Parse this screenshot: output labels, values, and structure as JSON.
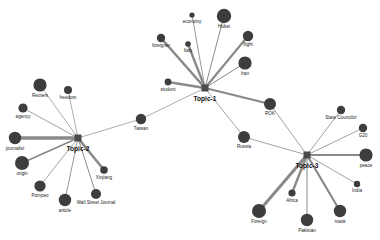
{
  "figure": {
    "kind": "topic-word-network",
    "background_color": "#ffffff",
    "node_color": "#3d3d3d",
    "topic_node_color": "#4a4a4a",
    "edge_color": "#8a8a8a",
    "label_color": "#1a1a1a"
  },
  "topics": [
    {
      "id": "topic1",
      "label": "Topic-1",
      "x": 205,
      "y": 88,
      "size": 7
    },
    {
      "id": "topic2",
      "label": "Topic-2",
      "x": 78,
      "y": 138,
      "size": 7
    },
    {
      "id": "topic3",
      "label": "Topic-3",
      "x": 307,
      "y": 155,
      "size": 7
    }
  ],
  "words": [
    {
      "id": "economy",
      "label": "economy",
      "x": 192,
      "y": 15,
      "r": 2.6,
      "label_dx": 0,
      "label_dy": 7
    },
    {
      "id": "hubei",
      "label": "Hubei",
      "x": 224,
      "y": 16,
      "r": 7.2,
      "label_dx": 0,
      "label_dy": 11
    },
    {
      "id": "foreigner",
      "label": "foreigner",
      "x": 161,
      "y": 38,
      "r": 4.2,
      "label_dx": 0,
      "label_dy": 8
    },
    {
      "id": "italy",
      "label": "Italy",
      "x": 188,
      "y": 44,
      "r": 2.8,
      "label_dx": 0,
      "label_dy": 6.5
    },
    {
      "id": "flight",
      "label": "flight",
      "x": 248,
      "y": 36,
      "r": 5.2,
      "label_dx": 0,
      "label_dy": 9
    },
    {
      "id": "iran",
      "label": "Iran",
      "x": 245,
      "y": 63,
      "r": 6.6,
      "label_dx": 0,
      "label_dy": 11
    },
    {
      "id": "student",
      "label": "student",
      "x": 168,
      "y": 82,
      "r": 3.4,
      "label_dx": 0,
      "label_dy": 7.5
    },
    {
      "id": "taiwan",
      "label": "Taiwan",
      "x": 141,
      "y": 119,
      "r": 5.2,
      "label_dx": 0,
      "label_dy": 9.5
    },
    {
      "id": "rok",
      "label": "ROK",
      "x": 270,
      "y": 104,
      "r": 6.0,
      "label_dx": 0,
      "label_dy": 10
    },
    {
      "id": "russia",
      "label": "Russia",
      "x": 244,
      "y": 137,
      "r": 6.0,
      "label_dx": 0,
      "label_dy": 10
    },
    {
      "id": "reuters",
      "label": "Reuters",
      "x": 40,
      "y": 85,
      "r": 6.6,
      "label_dx": 0,
      "label_dy": 11
    },
    {
      "id": "freedom",
      "label": "freedom",
      "x": 68,
      "y": 90,
      "r": 4.0,
      "label_dx": 0,
      "label_dy": 8
    },
    {
      "id": "agency",
      "label": "agency",
      "x": 23,
      "y": 108,
      "r": 4.6,
      "label_dx": 0,
      "label_dy": 8.5
    },
    {
      "id": "journalist",
      "label": "journalist",
      "x": 15,
      "y": 138,
      "r": 6.2,
      "label_dx": 0,
      "label_dy": 10.5
    },
    {
      "id": "origin",
      "label": "origin",
      "x": 22,
      "y": 163,
      "r": 7.0,
      "label_dx": 0,
      "label_dy": 11
    },
    {
      "id": "pompeo",
      "label": "Pompeo",
      "x": 40,
      "y": 186,
      "r": 5.6,
      "label_dx": 0,
      "label_dy": 9.5
    },
    {
      "id": "article",
      "label": "article",
      "x": 65,
      "y": 200,
      "r": 6.2,
      "label_dx": 0,
      "label_dy": 10.5
    },
    {
      "id": "wsj",
      "label": "Wall Street Journal",
      "x": 96,
      "y": 194,
      "r": 5.0,
      "label_dx": 0,
      "label_dy": 9
    },
    {
      "id": "xinjiang",
      "label": "Xinjiang",
      "x": 104,
      "y": 170,
      "r": 3.8,
      "label_dx": 0,
      "label_dy": 8
    },
    {
      "id": "statecouncilor",
      "label": "State Councilor",
      "x": 341,
      "y": 110,
      "r": 4.2,
      "label_dx": 0,
      "label_dy": 8
    },
    {
      "id": "g20",
      "label": "G20",
      "x": 363,
      "y": 128,
      "r": 4.2,
      "label_dx": 0,
      "label_dy": 8
    },
    {
      "id": "peace",
      "label": "peace",
      "x": 366,
      "y": 155,
      "r": 6.6,
      "label_dx": 0,
      "label_dy": 10.5
    },
    {
      "id": "india",
      "label": "India",
      "x": 357,
      "y": 184,
      "r": 3.2,
      "label_dx": 0,
      "label_dy": 7
    },
    {
      "id": "mask",
      "label": "mask",
      "x": 340,
      "y": 211,
      "r": 6.2,
      "label_dx": 0,
      "label_dy": 10.5
    },
    {
      "id": "pakistan",
      "label": "Pakistan",
      "x": 307,
      "y": 220,
      "r": 6.2,
      "label_dx": 0,
      "label_dy": 10.5
    },
    {
      "id": "africa",
      "label": "Africa",
      "x": 292,
      "y": 193,
      "r": 3.6,
      "label_dx": 0,
      "label_dy": 7.5
    },
    {
      "id": "foreign",
      "label": "Foreign",
      "x": 259,
      "y": 211,
      "r": 7.0,
      "label_dx": 0,
      "label_dy": 11
    }
  ],
  "edges": [
    {
      "from": "topic1",
      "to": "economy",
      "width": 0.9
    },
    {
      "from": "topic1",
      "to": "hubei",
      "width": 1.0
    },
    {
      "from": "topic1",
      "to": "foreigner",
      "width": 2.6
    },
    {
      "from": "topic1",
      "to": "italy",
      "width": 2.4
    },
    {
      "from": "topic1",
      "to": "flight",
      "width": 2.2
    },
    {
      "from": "topic1",
      "to": "iran",
      "width": 1.0
    },
    {
      "from": "topic1",
      "to": "student",
      "width": 2.4
    },
    {
      "from": "topic1",
      "to": "taiwan",
      "width": 0.7
    },
    {
      "from": "topic1",
      "to": "rok",
      "width": 2.2
    },
    {
      "from": "topic1",
      "to": "russia",
      "width": 0.8
    },
    {
      "from": "topic2",
      "to": "reuters",
      "width": 0.7
    },
    {
      "from": "topic2",
      "to": "freedom",
      "width": 0.7
    },
    {
      "from": "topic2",
      "to": "agency",
      "width": 0.8
    },
    {
      "from": "topic2",
      "to": "journalist",
      "width": 3.4
    },
    {
      "from": "topic2",
      "to": "origin",
      "width": 1.8
    },
    {
      "from": "topic2",
      "to": "pompeo",
      "width": 0.8
    },
    {
      "from": "topic2",
      "to": "article",
      "width": 0.9
    },
    {
      "from": "topic2",
      "to": "wsj",
      "width": 1.0
    },
    {
      "from": "topic2",
      "to": "xinjiang",
      "width": 2.6
    },
    {
      "from": "topic2",
      "to": "taiwan",
      "width": 0.7
    },
    {
      "from": "topic3",
      "to": "rok",
      "width": 0.8
    },
    {
      "from": "topic3",
      "to": "russia",
      "width": 0.8
    },
    {
      "from": "topic3",
      "to": "statecouncilor",
      "width": 0.8
    },
    {
      "from": "topic3",
      "to": "g20",
      "width": 0.8
    },
    {
      "from": "topic3",
      "to": "peace",
      "width": 2.0
    },
    {
      "from": "topic3",
      "to": "india",
      "width": 0.8
    },
    {
      "from": "topic3",
      "to": "mask",
      "width": 2.2
    },
    {
      "from": "topic3",
      "to": "pakistan",
      "width": 1.0
    },
    {
      "from": "topic3",
      "to": "africa",
      "width": 2.4
    },
    {
      "from": "topic3",
      "to": "foreign",
      "width": 3.0
    }
  ]
}
